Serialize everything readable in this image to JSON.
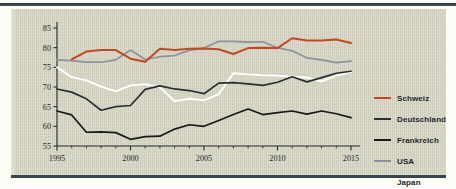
{
  "panel": {
    "background_color": "#d3d2c0",
    "border_color": "#3a4450"
  },
  "legend": {
    "position": "right",
    "items": [
      {
        "label": "Schweiz",
        "color": "#c6471f"
      },
      {
        "label": "Deutschland",
        "color": "#2b2f33"
      },
      {
        "label": "Frankreich",
        "color": "#17191b"
      },
      {
        "label": "USA",
        "color": "#8d929a"
      },
      {
        "label": "Japan",
        "color": "#ffffff"
      }
    ]
  },
  "chart_data": {
    "type": "line",
    "title": "",
    "subtitle": "",
    "xlabel": "",
    "ylabel": "",
    "xlim": [
      1995,
      2015
    ],
    "ylim": [
      55,
      85
    ],
    "grid": false,
    "legend_position": "right",
    "x": [
      1995,
      1996,
      1997,
      1998,
      1999,
      2000,
      2001,
      2002,
      2003,
      2004,
      2005,
      2006,
      2007,
      2008,
      2009,
      2010,
      2011,
      2012,
      2013,
      2014,
      2015
    ],
    "xticks": [
      1995,
      2000,
      2005,
      2010,
      2015
    ],
    "xtick_labels": [
      "1995",
      "2000",
      "2005",
      "2010",
      "2015"
    ],
    "xminor_step": 1,
    "yticks": [
      55,
      60,
      65,
      70,
      75,
      80,
      85
    ],
    "ytick_labels": [
      "55",
      "60",
      "65",
      "70",
      "75",
      "80",
      "85"
    ],
    "series": [
      {
        "name": "Schweiz",
        "color": "#c6471f",
        "values": [
          null,
          77.0,
          79.0,
          79.4,
          79.4,
          77.2,
          76.4,
          79.7,
          79.4,
          79.7,
          79.8,
          79.6,
          78.4,
          79.9,
          80.0,
          79.9,
          82.4,
          81.8,
          81.8,
          82.1,
          81.2
        ]
      },
      {
        "name": "Deutschland",
        "color": "#2b2f33",
        "values": [
          69.5,
          68.7,
          67.0,
          64.1,
          65.0,
          65.3,
          69.4,
          70.3,
          69.5,
          69.1,
          68.3,
          71.0,
          71.1,
          70.8,
          70.4,
          71.2,
          72.6,
          71.3,
          72.4,
          73.5,
          74.0
        ]
      },
      {
        "name": "Frankreich",
        "color": "#17191b",
        "values": [
          63.9,
          62.9,
          58.5,
          58.6,
          58.4,
          56.7,
          57.4,
          57.5,
          59.3,
          60.4,
          60.0,
          61.5,
          63.0,
          64.4,
          63.0,
          63.5,
          63.9,
          63.1,
          63.9,
          63.2,
          62.2
        ]
      },
      {
        "name": "USA",
        "color": "#8d929a",
        "values": [
          76.9,
          76.7,
          76.3,
          76.3,
          76.9,
          79.4,
          77.0,
          77.7,
          78.0,
          79.3,
          79.9,
          81.6,
          81.6,
          81.4,
          81.5,
          80.0,
          79.2,
          77.4,
          76.9,
          76.2,
          76.6
        ]
      },
      {
        "name": "Japan",
        "color": "#ffffff",
        "values": [
          75.0,
          72.5,
          71.7,
          70.1,
          68.9,
          70.4,
          70.7,
          69.9,
          66.4,
          67.0,
          66.6,
          68.2,
          73.5,
          73.2,
          73.0,
          72.9,
          72.6,
          72.4,
          71.4,
          72.9,
          73.8
        ]
      }
    ]
  }
}
